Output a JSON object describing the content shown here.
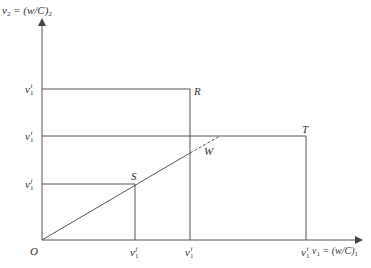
{
  "axes": {
    "y_label": {
      "main": "v",
      "sub": "2",
      "eq": " = (w/C)",
      "eq_sub": "2"
    },
    "x_label": {
      "main": "v",
      "sub": "1",
      "eq": " = (w/C)",
      "eq_sub": "1"
    },
    "origin": "O"
  },
  "y_ticks": [
    {
      "main": "v",
      "sub": "1",
      "sup": "i"
    },
    {
      "main": "v",
      "sub": "1",
      "sup": "t"
    },
    {
      "main": "v",
      "sub": "1",
      "sup": "j"
    }
  ],
  "x_ticks": [
    {
      "main": "v",
      "sub": "1",
      "sup": "j"
    },
    {
      "main": "v",
      "sub": "1",
      "sup": "i"
    },
    {
      "main": "v",
      "sub": "1",
      "sup": "t"
    }
  ],
  "points": {
    "R": "R",
    "T": "T",
    "S": "S",
    "W": "W"
  },
  "colors": {
    "line": "#555555",
    "text": "#333333"
  }
}
